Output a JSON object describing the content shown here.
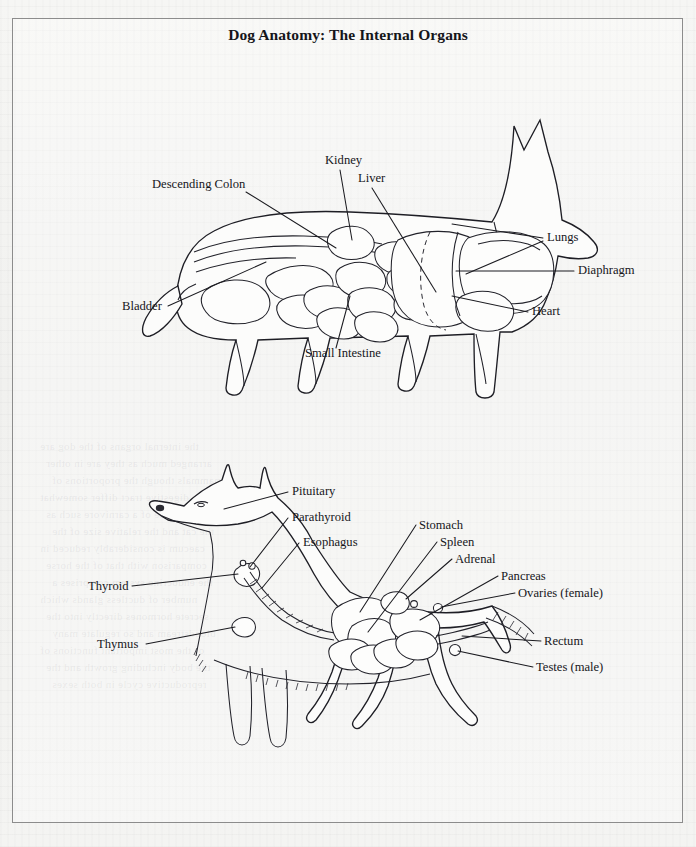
{
  "page": {
    "title": "Dog Anatomy: The Internal Organs",
    "background_color": "#f3f3f1",
    "frame_color": "#8c8c8c",
    "ink_color": "#16161b"
  },
  "figures": [
    {
      "id": "upper-figure",
      "name": "thoracic-and-abdominal-organs",
      "description": "Side view of a stippled dog showing digestive, urinary, respiratory and circulatory organs",
      "labels": [
        {
          "id": "descending-colon",
          "text": "Descending Colon",
          "x": 152,
          "y": 188,
          "anchor": "start"
        },
        {
          "id": "kidney",
          "text": "Kidney",
          "x": 325,
          "y": 164,
          "anchor": "start"
        },
        {
          "id": "liver",
          "text": "Liver",
          "x": 358,
          "y": 182,
          "anchor": "start"
        },
        {
          "id": "bladder",
          "text": "Bladder",
          "x": 122,
          "y": 310,
          "anchor": "start"
        },
        {
          "id": "small-intestine",
          "text": "Small Intestine",
          "x": 305,
          "y": 357,
          "anchor": "start"
        },
        {
          "id": "lungs",
          "text": "Lungs",
          "x": 547,
          "y": 241,
          "anchor": "start"
        },
        {
          "id": "diaphragm",
          "text": "Diaphragm",
          "x": 578,
          "y": 274,
          "anchor": "start"
        },
        {
          "id": "heart",
          "text": "Heart",
          "x": 532,
          "y": 315,
          "anchor": "start"
        }
      ]
    },
    {
      "id": "lower-figure",
      "name": "endocrine-and-reproductive-organs",
      "description": "Side view of an outlined dog showing endocrine glands, esophagus and reproductive organs",
      "labels": [
        {
          "id": "pituitary",
          "text": "Pituitary",
          "x": 292,
          "y": 495,
          "anchor": "start"
        },
        {
          "id": "parathyroid",
          "text": "Parathyroid",
          "x": 292,
          "y": 521,
          "anchor": "start"
        },
        {
          "id": "esophagus",
          "text": "Esophagus",
          "x": 303,
          "y": 546,
          "anchor": "start"
        },
        {
          "id": "thyroid",
          "text": "Thyroid",
          "x": 88,
          "y": 590,
          "anchor": "start"
        },
        {
          "id": "thymus",
          "text": "Thymus",
          "x": 97,
          "y": 648,
          "anchor": "start"
        },
        {
          "id": "stomach",
          "text": "Stomach",
          "x": 419,
          "y": 529,
          "anchor": "start"
        },
        {
          "id": "spleen",
          "text": "Spleen",
          "x": 440,
          "y": 546,
          "anchor": "start"
        },
        {
          "id": "adrenal",
          "text": "Adrenal",
          "x": 455,
          "y": 563,
          "anchor": "start"
        },
        {
          "id": "pancreas",
          "text": "Pancreas",
          "x": 501,
          "y": 580,
          "anchor": "start"
        },
        {
          "id": "ovaries-female",
          "text": "Ovaries (female)",
          "x": 518,
          "y": 597,
          "anchor": "start"
        },
        {
          "id": "rectum",
          "text": "Rectum",
          "x": 544,
          "y": 645,
          "anchor": "start"
        },
        {
          "id": "testes-male",
          "text": "Testes (male)",
          "x": 536,
          "y": 671,
          "anchor": "start"
        }
      ]
    }
  ],
  "bleed_through_lines": [
    "the internal organs of the dog are",
    "arranged much as they are in other",
    "mammals though the proportions of",
    "the digestive tract differ somewhat",
    "from those of a carnivore such as",
    "the cat and the relative size of the",
    "caecum is considerably reduced in",
    "comparison with that of the horse",
    "the endocrine system comprises a",
    "number of ductless glands which",
    "secrete hormones directly into the",
    "bloodstream and so regulate many",
    "of the most important functions of",
    "the body including growth and the",
    "reproductive cycle in both sexes"
  ]
}
